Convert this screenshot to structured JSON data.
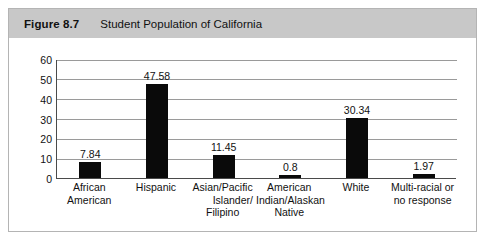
{
  "figure": {
    "number": "Figure 8.7",
    "caption": "Student Population of California"
  },
  "chart_data": {
    "type": "bar",
    "title": "Student Population of California",
    "xlabel": "",
    "ylabel": "",
    "ylim": [
      0,
      60
    ],
    "yticks": [
      0,
      10,
      20,
      30,
      40,
      50,
      60
    ],
    "ytick_labels": [
      "0",
      "10",
      "20",
      "30",
      "40",
      "50",
      "60"
    ],
    "grid": true,
    "legend": false,
    "bar_color": "#0a0a0a",
    "categories": [
      "African American",
      "Hispanic",
      "Asian/Pacific Islander/ Filipino",
      "American Indian/Alaskan Native",
      "White",
      "Multi-racial or no response"
    ],
    "category_lines": [
      [
        "African",
        "American"
      ],
      [
        "Hispanic"
      ],
      [
        "Asian/Pacific",
        "Islander/",
        "Filipino"
      ],
      [
        "American",
        "Indian/Alaskan",
        "Native"
      ],
      [
        "White"
      ],
      [
        "Multi-racial or",
        "no response"
      ]
    ],
    "values": [
      7.84,
      47.58,
      11.45,
      0.8,
      30.34,
      1.97
    ],
    "value_labels": [
      "7.84",
      "47.58",
      "11.45",
      "0.8",
      "30.34",
      "1.97"
    ]
  }
}
